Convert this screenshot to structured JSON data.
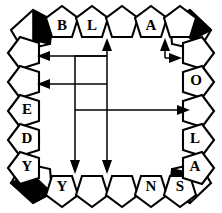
{
  "figure": {
    "background_color": "#ffffff",
    "stroke_color": "#000000",
    "fill_color": "#ffffff",
    "highlight_color": "#000000",
    "width": 222,
    "height": 213
  },
  "corners": [
    {
      "name": "corner-top-left",
      "label": "",
      "filled": true,
      "cx": 34,
      "cy": 31,
      "orientation": "up-left"
    },
    {
      "name": "corner-top-right",
      "label": "",
      "filled": true,
      "cx": 188,
      "cy": 31,
      "orientation": "up-right"
    },
    {
      "name": "corner-bottom-left",
      "label": "",
      "filled": true,
      "cx": 34,
      "cy": 182,
      "orientation": "down-left"
    },
    {
      "name": "corner-bottom-right",
      "label": "",
      "filled": true,
      "cx": 188,
      "cy": 182,
      "orientation": "down-right"
    }
  ],
  "rings": {
    "top": {
      "orientation": "up",
      "cells": [
        {
          "label": "B",
          "cx": 62,
          "cy": 23
        },
        {
          "label": "L",
          "cx": 92,
          "cy": 23
        },
        {
          "label": "",
          "cx": 122,
          "cy": 23
        },
        {
          "label": "A",
          "cx": 151,
          "cy": 23
        },
        {
          "label": "",
          "cx": 180,
          "cy": 23
        }
      ]
    },
    "right": {
      "orientation": "right",
      "cells": [
        {
          "label": "",
          "cx": 197,
          "cy": 53
        },
        {
          "label": "O",
          "cx": 197,
          "cy": 82
        },
        {
          "label": "",
          "cx": 197,
          "cy": 111
        },
        {
          "label": "L",
          "cx": 197,
          "cy": 140
        },
        {
          "label": "A",
          "cx": 197,
          "cy": 168
        }
      ]
    },
    "bottom": {
      "orientation": "down",
      "cells": [
        {
          "label": "Y",
          "cx": 62,
          "cy": 190
        },
        {
          "label": "",
          "cx": 92,
          "cy": 190
        },
        {
          "label": "",
          "cx": 122,
          "cy": 190
        },
        {
          "label": "N",
          "cx": 151,
          "cy": 190
        },
        {
          "label": "S",
          "cx": 180,
          "cy": 190
        }
      ]
    },
    "left": {
      "orientation": "left",
      "cells": [
        {
          "label": "",
          "cx": 25,
          "cy": 53
        },
        {
          "label": "",
          "cx": 25,
          "cy": 82
        },
        {
          "label": "E",
          "cx": 25,
          "cy": 111
        },
        {
          "label": "D",
          "cx": 25,
          "cy": 140
        },
        {
          "label": "Y",
          "cx": 25,
          "cy": 168
        }
      ]
    }
  },
  "flows": [
    {
      "name": "flow-up-to-top-middle",
      "from": "center-column-a",
      "to": "top-blank-cell-3",
      "direction": "up",
      "path": "M 107 84 L 107 45",
      "head": "107,38 103,50 111,50"
    },
    {
      "name": "flow-left-to-left-cell-1",
      "from": "center-column-b",
      "to": "left-blank-cell-1",
      "direction": "left",
      "path": "M 107 56 L 44 56",
      "head": "37,56 49,52 49,60"
    },
    {
      "name": "flow-left-to-left-cell-2",
      "from": "center-column-a",
      "to": "left-blank-cell-2",
      "direction": "left",
      "path": "M 107 84 L 44 84",
      "head": "37,84 49,80 49,88"
    },
    {
      "name": "flow-elbow-left-upper",
      "from": "corner-elbow",
      "to": "left-stem",
      "direction": "elbow",
      "path": "M 107 56 L 75 56 L 75 84"
    },
    {
      "name": "flow-right-to-right-cell-3",
      "from": "center-row",
      "to": "right-blank-cell-3",
      "direction": "right",
      "path": "M 75 110 L 183 110",
      "head": "190,110 178,106 178,114"
    },
    {
      "name": "flow-down-left",
      "from": "left-stem",
      "to": "bottom-blank-cell-2",
      "direction": "down",
      "path": "M 75 84 L 75 166",
      "head": "75,173 71,161 79,161"
    },
    {
      "name": "flow-down-right",
      "from": "center-column-a",
      "to": "bottom-blank-cell-3",
      "direction": "down",
      "path": "M 107 84 L 107 166",
      "head": "107,173 103,161 111,161"
    },
    {
      "name": "flow-up-to-top-cell-5",
      "from": "right-elbow",
      "to": "top-blank-cell-5",
      "direction": "up",
      "path": "M 165 57 L 165 45",
      "head": "165,38 161,50 169,50"
    },
    {
      "name": "flow-right-to-right-cell-1",
      "from": "right-elbow",
      "to": "right-blank-cell-1",
      "direction": "right",
      "path": "M 165 57 L 175 57",
      "head": "182,57 170,53 170,61"
    }
  ]
}
